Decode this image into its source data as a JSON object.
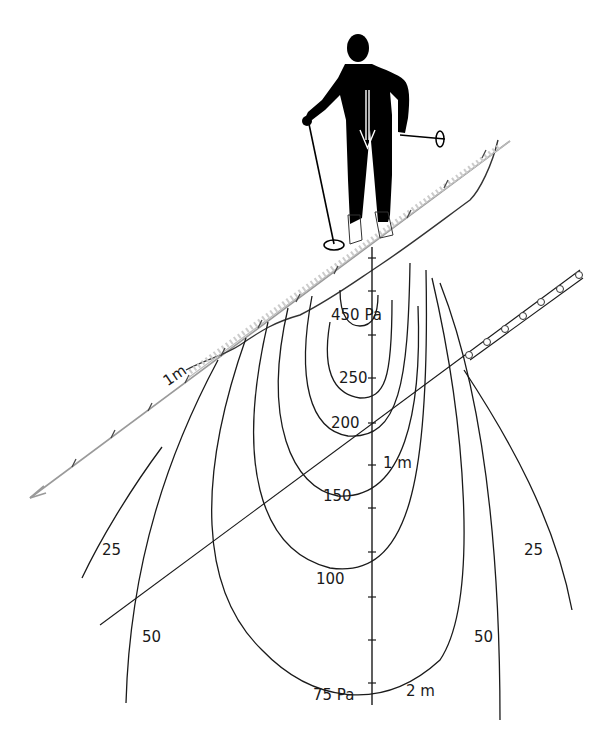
{
  "figure": {
    "colors": {
      "ink": "#1a1a1a",
      "silhouette": "#000000",
      "slope_arrow": "#9a9a9a",
      "background": "#ffffff"
    }
  },
  "slope": {
    "scale_label": "1m",
    "arrow": "downslope-arrow"
  },
  "axis": {
    "label_1m": "1 m",
    "label_2m": "2 m"
  },
  "isobars": [
    {
      "value": "450 Pa"
    },
    {
      "value": "250"
    },
    {
      "value": "200"
    },
    {
      "value": "150"
    },
    {
      "value": "100"
    },
    {
      "value": "75 Pa"
    },
    {
      "value": "50",
      "side": "left"
    },
    {
      "value": "50",
      "side": "right"
    },
    {
      "value": "25",
      "side": "left"
    },
    {
      "value": "25",
      "side": "right"
    }
  ],
  "weak_layer": {
    "description": "buried layer with embedded grains"
  }
}
